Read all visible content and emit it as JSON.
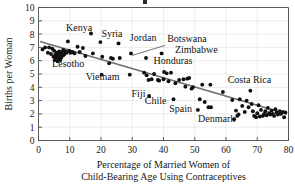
{
  "chart_data": {
    "type": "scatter",
    "title": "",
    "xlabel": "Percentage of Married Women of Child-Bearing Age Using Contraceptives",
    "xlabel_line1": "Percentage of Married Women of",
    "xlabel_line2": "Child-Bearing Age Using Contraceptives",
    "ylabel": "Births per Woman",
    "xlim": [
      0,
      80
    ],
    "ylim": [
      0,
      10
    ],
    "xticks": [
      0,
      10,
      20,
      30,
      40,
      50,
      60,
      70,
      80
    ],
    "yticks": [
      0,
      1,
      2,
      3,
      4,
      5,
      6,
      7,
      8,
      9,
      10
    ],
    "grid": true,
    "legend": "none",
    "marker": "filled-circle",
    "marker_color": "#101010",
    "trend_line": {
      "label": "least-squares regression line",
      "color": "#6e6e6e",
      "x_start": 0.5,
      "y_start": 7.45,
      "x_end": 79.5,
      "y_end": 2.0
    },
    "points": [
      [
        1.3,
        6.85
      ],
      [
        2.1,
        7.0
      ],
      [
        3.0,
        6.6
      ],
      [
        3.4,
        7.0
      ],
      [
        4.0,
        6.5
      ],
      [
        4.4,
        6.9
      ],
      [
        4.8,
        6.3
      ],
      [
        5.0,
        6.75
      ],
      [
        5.2,
        6.05
      ],
      [
        5.4,
        6.45
      ],
      [
        5.6,
        6.2
      ],
      [
        5.8,
        6.6
      ],
      [
        6.0,
        6.3
      ],
      [
        6.1,
        5.95
      ],
      [
        6.3,
        6.5
      ],
      [
        6.5,
        6.15
      ],
      [
        6.6,
        6.7
      ],
      [
        6.8,
        6.35
      ],
      [
        7.0,
        6.05
      ],
      [
        7.1,
        6.55
      ],
      [
        7.3,
        6.25
      ],
      [
        7.5,
        6.65
      ],
      [
        7.7,
        6.4
      ],
      [
        7.9,
        6.8
      ],
      [
        8.2,
        6.45
      ],
      [
        8.6,
        6.7
      ],
      [
        9.0,
        6.6
      ],
      [
        9.4,
        7.45
      ],
      [
        9.8,
        6.75
      ],
      [
        10.2,
        6.6
      ],
      [
        10.8,
        6.65
      ],
      [
        11.5,
        6.55
      ],
      [
        12.5,
        7.05
      ],
      [
        13.2,
        6.65
      ],
      [
        14.2,
        6.95
      ],
      [
        15.0,
        6.35
      ],
      [
        16.8,
        8.05
      ],
      [
        17.4,
        6.55
      ],
      [
        19.8,
        7.4
      ],
      [
        20.2,
        4.95
      ],
      [
        20.4,
        6.3
      ],
      [
        22.6,
        5.8
      ],
      [
        23.2,
        6.2
      ],
      [
        23.8,
        6.15
      ],
      [
        25.6,
        7.3
      ],
      [
        26.0,
        6.2
      ],
      [
        29.2,
        4.95
      ],
      [
        29.6,
        6.55
      ],
      [
        33.8,
        5.1
      ],
      [
        34.4,
        6.2
      ],
      [
        34.6,
        4.9
      ],
      [
        35.2,
        4.55
      ],
      [
        35.4,
        3.35
      ],
      [
        36.2,
        4.6
      ],
      [
        37.0,
        5.0
      ],
      [
        38.2,
        4.55
      ],
      [
        38.6,
        4.5
      ],
      [
        39.4,
        6.55
      ],
      [
        40.0,
        4.6
      ],
      [
        40.2,
        5.15
      ],
      [
        41.0,
        5.05
      ],
      [
        41.6,
        4.45
      ],
      [
        42.4,
        5.1
      ],
      [
        43.2,
        3.1
      ],
      [
        43.8,
        4.3
      ],
      [
        45.0,
        4.55
      ],
      [
        46.4,
        4.6
      ],
      [
        47.0,
        4.05
      ],
      [
        47.6,
        4.65
      ],
      [
        48.2,
        4.7
      ],
      [
        49.0,
        3.9
      ],
      [
        49.4,
        4.0
      ],
      [
        51.0,
        2.3
      ],
      [
        51.6,
        3.1
      ],
      [
        52.4,
        4.2
      ],
      [
        53.2,
        2.9
      ],
      [
        54.4,
        2.5
      ],
      [
        55.0,
        4.2
      ],
      [
        55.2,
        2.5
      ],
      [
        59.0,
        3.65
      ],
      [
        62.0,
        3.05
      ],
      [
        62.6,
        1.6
      ],
      [
        63.2,
        2.25
      ],
      [
        63.6,
        1.85
      ],
      [
        64.0,
        1.95
      ],
      [
        64.4,
        3.1
      ],
      [
        65.2,
        2.6
      ],
      [
        66.0,
        2.15
      ],
      [
        66.6,
        3.0
      ],
      [
        67.2,
        2.5
      ],
      [
        67.8,
        3.75
      ],
      [
        68.2,
        2.75
      ],
      [
        68.6,
        2.2
      ],
      [
        69.0,
        1.85
      ],
      [
        69.6,
        1.75
      ],
      [
        70.0,
        2.05
      ],
      [
        70.4,
        2.65
      ],
      [
        70.8,
        1.8
      ],
      [
        71.2,
        2.3
      ],
      [
        71.8,
        1.85
      ],
      [
        72.2,
        2.0
      ],
      [
        72.6,
        2.2
      ],
      [
        73.0,
        1.9
      ],
      [
        73.4,
        2.45
      ],
      [
        73.8,
        2.05
      ],
      [
        74.2,
        1.95
      ],
      [
        74.6,
        2.25
      ],
      [
        75.0,
        2.0
      ],
      [
        75.4,
        1.85
      ],
      [
        75.8,
        2.35
      ],
      [
        76.2,
        2.1
      ],
      [
        76.6,
        1.95
      ],
      [
        77.2,
        2.2
      ],
      [
        77.6,
        2.0
      ],
      [
        78.2,
        2.15
      ],
      [
        78.6,
        1.75
      ],
      [
        79.0,
        2.1
      ]
    ],
    "annotations": [
      {
        "label": "Kenya",
        "text_x": 13.0,
        "text_y": 8.2,
        "anchor": "middle",
        "leader": false
      },
      {
        "label": "Syria",
        "text_x": 23.5,
        "text_y": 7.75,
        "anchor": "middle",
        "leader": false
      },
      {
        "label": "Jordan",
        "text_x": 33.5,
        "text_y": 7.45,
        "anchor": "middle",
        "leader": false
      },
      {
        "label": "Botswana",
        "text_x": 47.5,
        "text_y": 7.4,
        "anchor": "middle",
        "leader": true,
        "leader_x1": 40.5,
        "leader_y1": 7.15,
        "leader_x2": 30.0,
        "leader_y2": 6.4
      },
      {
        "label": "Zimbabwe",
        "text_x": 50.5,
        "text_y": 6.6,
        "anchor": "middle",
        "leader": false
      },
      {
        "label": "Honduras",
        "text_x": 43.0,
        "text_y": 5.75,
        "anchor": "middle",
        "leader": false
      },
      {
        "label": "Lesotho",
        "text_x": 9.5,
        "text_y": 5.55,
        "anchor": "middle",
        "leader": false
      },
      {
        "label": "Vietnam",
        "text_x": 20.5,
        "text_y": 4.55,
        "anchor": "middle",
        "leader": false
      },
      {
        "label": "Costa Rica",
        "text_x": 67.5,
        "text_y": 4.3,
        "anchor": "middle",
        "leader": false
      },
      {
        "label": "Fiji",
        "text_x": 32.0,
        "text_y": 3.3,
        "anchor": "middle",
        "leader": false
      },
      {
        "label": "Chile",
        "text_x": 37.5,
        "text_y": 2.75,
        "anchor": "middle",
        "leader": false
      },
      {
        "label": "Spain",
        "text_x": 45.5,
        "text_y": 2.15,
        "anchor": "middle",
        "leader": false
      },
      {
        "label": "Denmark",
        "text_x": 57.0,
        "text_y": 1.4,
        "anchor": "middle",
        "leader": false
      }
    ]
  }
}
